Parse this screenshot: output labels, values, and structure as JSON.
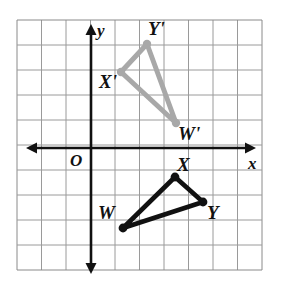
{
  "figure": {
    "type": "coordinate-plane-transformation",
    "background_color": "#ffffff",
    "grid": {
      "line_color": "#9a9a9a",
      "border_color": "#8a8a8a",
      "columns": 10,
      "rows": 10,
      "cell_width_px": 24.5,
      "cell_height_px": 25,
      "left_px": 17,
      "top_px": 20,
      "right_px": 262,
      "bottom_px": 270,
      "show_tick_numbers": false
    },
    "axes": {
      "color": "#111111",
      "origin_px": {
        "x": 91,
        "y": 148
      },
      "x_axis": {
        "label": "x",
        "label_px": {
          "x": 249,
          "y": 157
        },
        "arrow_both_ends": true
      },
      "y_axis": {
        "label": "y",
        "label_px": {
          "x": 98,
          "y": 23
        },
        "arrow_both_ends": true
      },
      "origin_label": "O",
      "origin_label_px": {
        "x": 72,
        "y": 153
      }
    }
  },
  "chart_data": {
    "type": "scatter",
    "title": "",
    "xlabel": "x",
    "ylabel": "y",
    "grid": true,
    "legend": null,
    "xlim": [
      -3,
      7
    ],
    "ylim": [
      -5.1,
      4.9
    ],
    "series": [
      {
        "name": "Triangle WXY (preimage)",
        "color": "#111111",
        "closed": true,
        "points": [
          {
            "label": "W",
            "x": 1.3,
            "y": -3.2,
            "px": {
              "x": 123,
              "y": 228
            }
          },
          {
            "label": "X",
            "x": 3.4,
            "y": -1.2,
            "px": {
              "x": 175,
              "y": 177
            }
          },
          {
            "label": "Y",
            "x": 4.6,
            "y": -2.2,
            "px": {
              "x": 203,
              "y": 202
            }
          }
        ]
      },
      {
        "name": "Triangle W'X'Y' (image)",
        "color": "#a8a8a8",
        "closed": true,
        "points": [
          {
            "label": "X'",
            "x": 1.2,
            "y": 3.0,
            "px": {
              "x": 121,
              "y": 72
            }
          },
          {
            "label": "Y'",
            "x": 2.3,
            "y": 4.2,
            "px": {
              "x": 147,
              "y": 44
            }
          },
          {
            "label": "W'",
            "x": 3.5,
            "y": 1.0,
            "px": {
              "x": 176,
              "y": 123
            }
          }
        ]
      }
    ]
  },
  "labels": {
    "W": {
      "text": "W",
      "px": {
        "x": 98,
        "y": 203
      },
      "size": "sz-lg"
    },
    "X": {
      "text": "X",
      "px": {
        "x": 177,
        "y": 155
      },
      "size": "sz-lg"
    },
    "Y": {
      "text": "Y",
      "px": {
        "x": 207,
        "y": 203
      },
      "size": "sz-lg"
    },
    "X_prime": {
      "text": "X'",
      "px": {
        "x": 99,
        "y": 72
      },
      "size": "sz-lg"
    },
    "Y_prime": {
      "text": "Y'",
      "px": {
        "x": 148,
        "y": 19
      },
      "size": "sz-lg"
    },
    "W_prime": {
      "text": "W'",
      "px": {
        "x": 178,
        "y": 124
      },
      "size": "sz-lg"
    },
    "origin": {
      "text": "O",
      "px": {
        "x": 70,
        "y": 152
      },
      "size": "sz-md"
    },
    "x_axis": {
      "text": "x",
      "px": {
        "x": 248,
        "y": 155
      },
      "size": "sz-md"
    },
    "y_axis": {
      "text": "y",
      "px": {
        "x": 97,
        "y": 22
      },
      "size": "sz-md"
    }
  }
}
